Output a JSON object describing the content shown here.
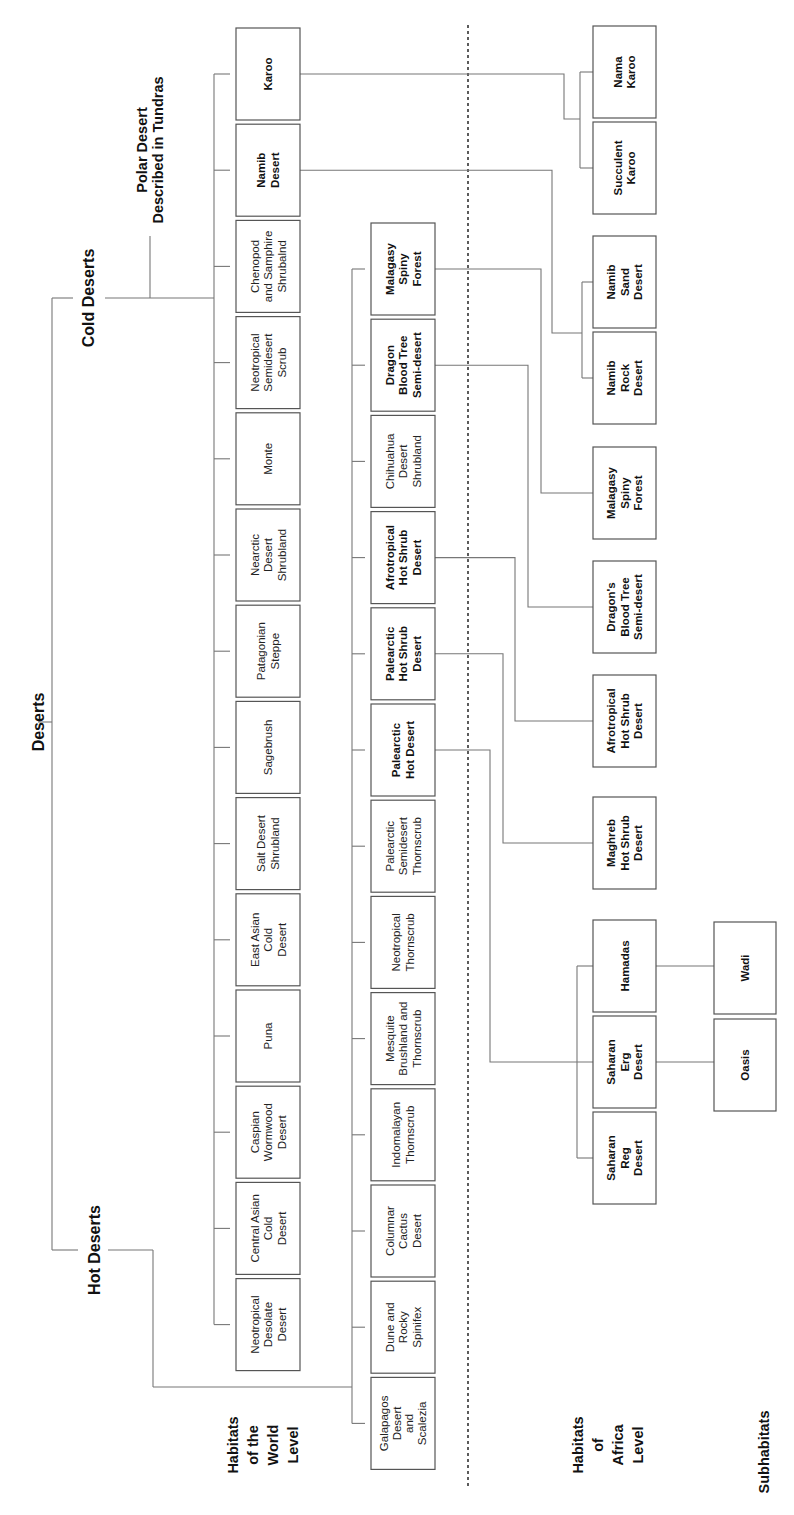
{
  "title": "Deserts",
  "branches": {
    "cold": "Cold Deserts",
    "hot": "Hot Deserts",
    "polar": [
      "Polar Desert",
      "Described in Tundras"
    ]
  },
  "level_labels": {
    "world": [
      "Habitats",
      "of the",
      "World",
      "Level"
    ],
    "africa": [
      "Habitats",
      "of",
      "Africa",
      "Level"
    ],
    "sub": [
      "Subhabitats"
    ]
  },
  "cold_habitats": [
    {
      "id": "karoo",
      "lines": [
        "Karoo"
      ],
      "bold": true
    },
    {
      "id": "namib-desert",
      "lines": [
        "Namib",
        "Desert"
      ],
      "bold": true
    },
    {
      "id": "chenopod",
      "lines": [
        "Chenopod",
        "and Samphire",
        "Shrubalnd"
      ],
      "bold": false
    },
    {
      "id": "neotropical-semidesert",
      "lines": [
        "Neotropical",
        "Semidesert",
        "Scrub"
      ],
      "bold": false
    },
    {
      "id": "monte",
      "lines": [
        "Monte"
      ],
      "bold": false
    },
    {
      "id": "nearctic-desert",
      "lines": [
        "Nearctic",
        "Desert",
        "Shrubland"
      ],
      "bold": false
    },
    {
      "id": "patagonian-steppe",
      "lines": [
        "Patagonian",
        "Steppe"
      ],
      "bold": false
    },
    {
      "id": "sagebrush",
      "lines": [
        "Sagebrush"
      ],
      "bold": false
    },
    {
      "id": "salt-desert",
      "lines": [
        "Salt Desert",
        "Shrubland"
      ],
      "bold": false
    },
    {
      "id": "east-asian-cold",
      "lines": [
        "East Asian",
        "Cold",
        "Desert"
      ],
      "bold": false
    },
    {
      "id": "puna",
      "lines": [
        "Puna"
      ],
      "bold": false
    },
    {
      "id": "caspian-wormwood",
      "lines": [
        "Caspian",
        "Wormwood",
        "Desert"
      ],
      "bold": false
    },
    {
      "id": "central-asian-cold",
      "lines": [
        "Central Asian",
        "Cold",
        "Desert"
      ],
      "bold": false
    },
    {
      "id": "neotropical-desolate",
      "lines": [
        "Neotropical",
        "Desolate",
        "Desert"
      ],
      "bold": false
    }
  ],
  "hot_habitats": [
    {
      "id": "malagasy-spiny",
      "lines": [
        "Malagasy",
        "Spiny",
        "Forest"
      ],
      "bold": true
    },
    {
      "id": "dragon-blood",
      "lines": [
        "Dragon",
        "Blood Tree",
        "Semi-desert"
      ],
      "bold": true
    },
    {
      "id": "chihuahua",
      "lines": [
        "Chihuahua",
        "Desert",
        "Shrubland"
      ],
      "bold": false
    },
    {
      "id": "afrotropical-hot-shrub",
      "lines": [
        "Afrotropical",
        "Hot Shrub",
        "Desert"
      ],
      "bold": true
    },
    {
      "id": "palearctic-hot-shrub",
      "lines": [
        "Palearctic",
        "Hot Shrub",
        "Desert"
      ],
      "bold": true
    },
    {
      "id": "palearctic-hot-desert",
      "lines": [
        "Palearctic",
        "Hot Desert"
      ],
      "bold": true
    },
    {
      "id": "palearctic-semidesert",
      "lines": [
        "Palearctic",
        "Semidesert",
        "Thornscrub"
      ],
      "bold": false
    },
    {
      "id": "neotropical-thornscrub",
      "lines": [
        "Neotropical",
        "Thornscrub"
      ],
      "bold": false
    },
    {
      "id": "mesquite",
      "lines": [
        "Mesquite",
        "Brushland and",
        "Thornscrub"
      ],
      "bold": false
    },
    {
      "id": "indomalayan",
      "lines": [
        "Indomalayan",
        "Thornscrub"
      ],
      "bold": false
    },
    {
      "id": "columnar-cactus",
      "lines": [
        "Columnar",
        "Cactus",
        "Desert"
      ],
      "bold": false
    },
    {
      "id": "dune-rocky",
      "lines": [
        "Dune and",
        "Rocky",
        "Spinifex"
      ],
      "bold": false
    },
    {
      "id": "galapagos",
      "lines": [
        "Galapagos",
        "Desert",
        "and",
        "Scalezia"
      ],
      "bold": false
    }
  ],
  "africa_habitats": [
    {
      "id": "nama-karoo",
      "lines": [
        "Nama",
        "Karoo"
      ],
      "bold": true
    },
    {
      "id": "succulent-karoo",
      "lines": [
        "Succulent",
        "Karoo"
      ],
      "bold": true
    },
    {
      "id": "namib-sand",
      "lines": [
        "Namib",
        "Sand",
        "Desert"
      ],
      "bold": true
    },
    {
      "id": "namib-rock",
      "lines": [
        "Namib",
        "Rock",
        "Desert"
      ],
      "bold": true
    },
    {
      "id": "malagasy-spiny-af",
      "lines": [
        "Malagasy",
        "Spiny",
        "Forest"
      ],
      "bold": true
    },
    {
      "id": "dragons-blood",
      "lines": [
        "Dragon's",
        "Blood Tree",
        "Semi-desert"
      ],
      "bold": true
    },
    {
      "id": "afrotropical-af",
      "lines": [
        "Afrotropical",
        "Hot Shrub",
        "Desert"
      ],
      "bold": true
    },
    {
      "id": "maghreb",
      "lines": [
        "Maghreb",
        "Hot Shrub",
        "Desert"
      ],
      "bold": true
    },
    {
      "id": "hamadas",
      "lines": [
        "Hamadas"
      ],
      "bold": true
    },
    {
      "id": "saharan-erg",
      "lines": [
        "Saharan",
        "Erg",
        "Desert"
      ],
      "bold": true
    },
    {
      "id": "saharan-reg",
      "lines": [
        "Saharan",
        "Reg",
        "Desert"
      ],
      "bold": true
    }
  ],
  "subhabitats": [
    {
      "id": "wadi",
      "lines": [
        "Wadi"
      ],
      "bold": true
    },
    {
      "id": "oasis",
      "lines": [
        "Oasis"
      ],
      "bold": true
    }
  ]
}
